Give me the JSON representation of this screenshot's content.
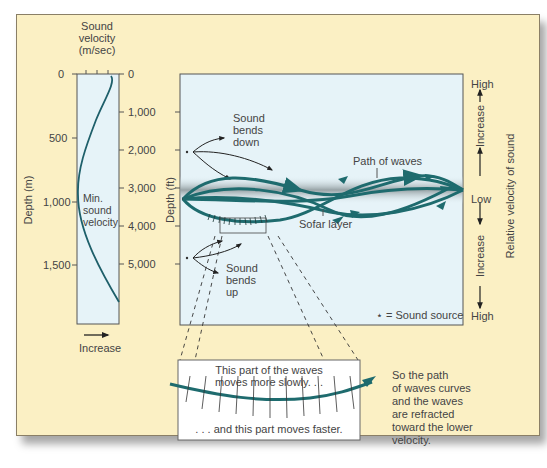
{
  "profile_panel": {
    "title_lines": [
      "Sound",
      "velocity",
      "(m/sec)"
    ],
    "depth_m_label": "Depth (m)",
    "depth_m_ticks": [
      "0",
      "500",
      "1,000",
      "1,500"
    ],
    "depth_ft_ticks": [
      "0",
      "1,000",
      "2,000",
      "3,000",
      "4,000",
      "5,000"
    ],
    "min_velocity_lines": [
      "Min.",
      "sound",
      "velocity"
    ],
    "increase_label": "Increase"
  },
  "main_panel": {
    "depth_ft_label": "Depth (ft)",
    "bends_down_lines": [
      "Sound",
      "bends",
      "down"
    ],
    "bends_up_lines": [
      "Sound",
      "bends",
      "up"
    ],
    "path_label": "Path of waves",
    "sofar_label": "Sofar layer",
    "legend": "⋆ = Sound source"
  },
  "right_scale": {
    "high_top": "High",
    "increase_top": "Increase",
    "low": "Low",
    "increase_bottom": "Increase",
    "high_bottom": "High",
    "axis_label": "Relative velocity of sound"
  },
  "detail_box": {
    "top_text_lines": [
      "This part of the waves",
      "moves more slowly. . ."
    ],
    "bottom_text": ". . . and this part moves faster."
  },
  "conclusion_lines": [
    "So the path",
    "of waves curves",
    "and the waves",
    "are refracted",
    "toward the lower",
    "velocity."
  ],
  "colors": {
    "background": "#fbf0c4",
    "panel": "#e6f3f8",
    "wave": "#1e6b6e",
    "sofar_band": "#9aa3a6"
  }
}
